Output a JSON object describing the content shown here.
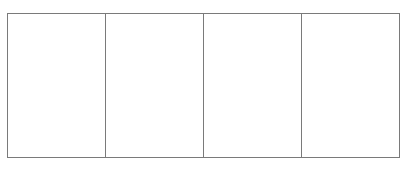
{
  "diagram": {
    "type": "panel-grid",
    "rows": 1,
    "columns": 4,
    "border_color": "#7a7a7a",
    "background_color": "#ffffff",
    "panels": [
      {
        "index": 1,
        "content": ""
      },
      {
        "index": 2,
        "content": ""
      },
      {
        "index": 3,
        "content": ""
      },
      {
        "index": 4,
        "content": ""
      }
    ]
  }
}
